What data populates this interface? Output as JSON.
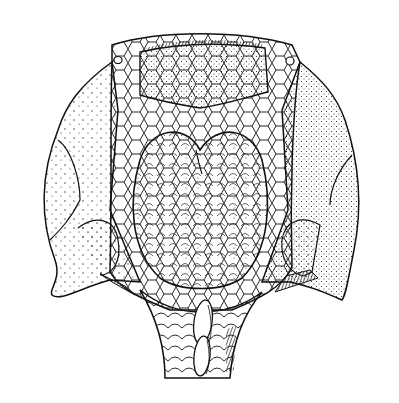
{
  "figure": {
    "style": "pen-and-ink line drawing with stipple shading",
    "colors": {
      "background": "#ffffff",
      "ink": "#111111"
    },
    "parts": [
      "rostral-plate",
      "orbit-left",
      "orbit-right",
      "cornual-plate-left",
      "cornual-plate-right",
      "lateral-plate-left",
      "lateral-plate-right",
      "median-dorsal-field",
      "polygonal-tesserae",
      "trunk-scales",
      "dorsal-ridge-scales"
    ]
  }
}
